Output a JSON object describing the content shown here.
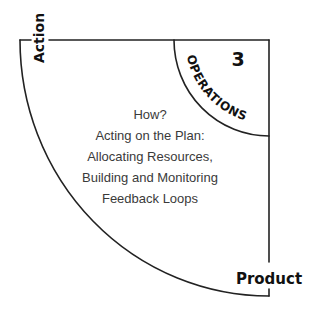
{
  "diagram": {
    "axes": {
      "vertical_label": "Action",
      "horizontal_label": "Product"
    },
    "sector": {
      "number": "3",
      "name": "OPERATIONS"
    },
    "description": {
      "lines": [
        "How?",
        "Acting on the Plan:",
        "Allocating Resources,",
        "Building and Monitoring",
        "Feedback Loops"
      ]
    },
    "colors": {
      "stroke": "#222222",
      "label_text": "#111111",
      "body_text": "#3a3a3a",
      "background": "#ffffff"
    }
  }
}
